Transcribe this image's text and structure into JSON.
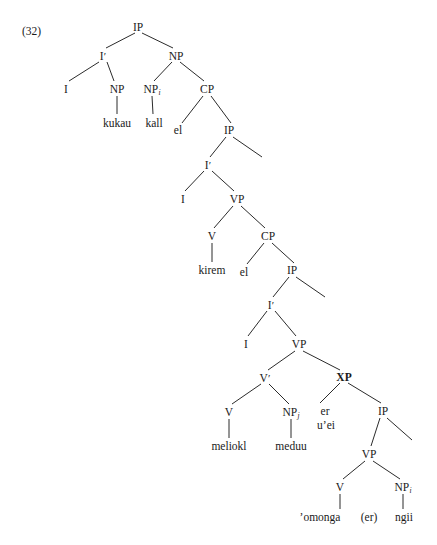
{
  "figure": {
    "example_number": "(32)",
    "cutoff_text_above": "",
    "language": "Palauan syntax tree",
    "line_color": "#2b2b2b",
    "text_color": "#1a1a1a",
    "background_color": "#ffffff"
  },
  "nodes": [
    {
      "id": "ip1",
      "label": "IP",
      "x": 138,
      "y": 28,
      "bold": false,
      "sub": "",
      "prime": false,
      "kind": "category"
    },
    {
      "id": "ibar1",
      "label": "I",
      "x": 103,
      "y": 57,
      "bold": false,
      "sub": "",
      "prime": true,
      "kind": "category"
    },
    {
      "id": "np1",
      "label": "NP",
      "x": 176,
      "y": 57,
      "bold": false,
      "sub": "",
      "prime": false,
      "kind": "category"
    },
    {
      "id": "i1",
      "label": "I",
      "x": 66,
      "y": 90,
      "bold": false,
      "sub": "",
      "prime": false,
      "kind": "category"
    },
    {
      "id": "np2",
      "label": "NP",
      "x": 117,
      "y": 90,
      "bold": false,
      "sub": "",
      "prime": false,
      "kind": "category"
    },
    {
      "id": "np3",
      "label": "NP",
      "x": 152,
      "y": 90,
      "bold": false,
      "sub": "i",
      "prime": false,
      "kind": "category"
    },
    {
      "id": "cp1",
      "label": "CP",
      "x": 207,
      "y": 90,
      "bold": false,
      "sub": "",
      "prime": false,
      "kind": "category"
    },
    {
      "id": "kukau",
      "label": "kukau",
      "x": 117,
      "y": 124,
      "bold": false,
      "sub": "",
      "prime": false,
      "kind": "terminal"
    },
    {
      "id": "kall",
      "label": "kall",
      "x": 154,
      "y": 124,
      "bold": false,
      "sub": "",
      "prime": false,
      "kind": "terminal"
    },
    {
      "id": "el1",
      "label": "el",
      "x": 178,
      "y": 131,
      "bold": false,
      "sub": "",
      "prime": false,
      "kind": "terminal"
    },
    {
      "id": "ip2",
      "label": "IP",
      "x": 229,
      "y": 131,
      "bold": false,
      "sub": "",
      "prime": false,
      "kind": "category"
    },
    {
      "id": "ibar2",
      "label": "I",
      "x": 208,
      "y": 166,
      "bold": false,
      "sub": "",
      "prime": true,
      "kind": "category"
    },
    {
      "id": "i2",
      "label": "I",
      "x": 183,
      "y": 200,
      "bold": false,
      "sub": "",
      "prime": false,
      "kind": "category"
    },
    {
      "id": "vp1",
      "label": "VP",
      "x": 237,
      "y": 200,
      "bold": false,
      "sub": "",
      "prime": false,
      "kind": "category"
    },
    {
      "id": "v1",
      "label": "V",
      "x": 212,
      "y": 237,
      "bold": false,
      "sub": "",
      "prime": false,
      "kind": "category"
    },
    {
      "id": "cp2",
      "label": "CP",
      "x": 268,
      "y": 237,
      "bold": false,
      "sub": "",
      "prime": false,
      "kind": "category"
    },
    {
      "id": "kirem",
      "label": "kirem",
      "x": 212,
      "y": 271,
      "bold": false,
      "sub": "",
      "prime": false,
      "kind": "terminal"
    },
    {
      "id": "el2",
      "label": "el",
      "x": 244,
      "y": 273,
      "bold": false,
      "sub": "",
      "prime": false,
      "kind": "terminal"
    },
    {
      "id": "ip3",
      "label": "IP",
      "x": 292,
      "y": 271,
      "bold": false,
      "sub": "",
      "prime": false,
      "kind": "category"
    },
    {
      "id": "ibar3",
      "label": "I",
      "x": 271,
      "y": 306,
      "bold": false,
      "sub": "",
      "prime": true,
      "kind": "category"
    },
    {
      "id": "i3",
      "label": "I",
      "x": 246,
      "y": 345,
      "bold": false,
      "sub": "",
      "prime": false,
      "kind": "category"
    },
    {
      "id": "vp2",
      "label": "VP",
      "x": 299,
      "y": 345,
      "bold": false,
      "sub": "",
      "prime": false,
      "kind": "category"
    },
    {
      "id": "vbar1",
      "label": "V",
      "x": 265,
      "y": 379,
      "bold": false,
      "sub": "",
      "prime": true,
      "kind": "category"
    },
    {
      "id": "xp1",
      "label": "XP",
      "x": 344,
      "y": 378,
      "bold": true,
      "sub": "",
      "prime": false,
      "kind": "category"
    },
    {
      "id": "v2",
      "label": "V",
      "x": 229,
      "y": 413,
      "bold": false,
      "sub": "",
      "prime": false,
      "kind": "category"
    },
    {
      "id": "np4",
      "label": "NP",
      "x": 291,
      "y": 413,
      "bold": false,
      "sub": "j",
      "prime": false,
      "kind": "category"
    },
    {
      "id": "er1",
      "label": "er",
      "x": 325,
      "y": 412,
      "bold": false,
      "sub": "",
      "prime": false,
      "kind": "terminal"
    },
    {
      "id": "uei",
      "label": "u’ei",
      "x": 326,
      "y": 426,
      "bold": false,
      "sub": "",
      "prime": false,
      "kind": "terminal"
    },
    {
      "id": "ip4",
      "label": "IP",
      "x": 383,
      "y": 412,
      "bold": false,
      "sub": "",
      "prime": false,
      "kind": "category"
    },
    {
      "id": "meliokl",
      "label": "meliokl",
      "x": 229,
      "y": 447,
      "bold": false,
      "sub": "",
      "prime": false,
      "kind": "terminal"
    },
    {
      "id": "meduu",
      "label": "meduu",
      "x": 291,
      "y": 447,
      "bold": false,
      "sub": "",
      "prime": false,
      "kind": "terminal"
    },
    {
      "id": "vp3",
      "label": "VP",
      "x": 369,
      "y": 455,
      "bold": false,
      "sub": "",
      "prime": false,
      "kind": "category"
    },
    {
      "id": "v3",
      "label": "V",
      "x": 340,
      "y": 488,
      "bold": false,
      "sub": "",
      "prime": false,
      "kind": "category"
    },
    {
      "id": "np5",
      "label": "NP",
      "x": 403,
      "y": 488,
      "bold": false,
      "sub": "i",
      "prime": false,
      "kind": "category"
    },
    {
      "id": "omonga",
      "label": "’omonga",
      "x": 320,
      "y": 518,
      "bold": false,
      "sub": "",
      "prime": false,
      "kind": "terminal"
    },
    {
      "id": "erparen",
      "label": "(er)",
      "x": 369,
      "y": 518,
      "bold": false,
      "sub": "",
      "prime": false,
      "kind": "terminal"
    },
    {
      "id": "ngii",
      "label": "ngii",
      "x": 404,
      "y": 518,
      "bold": false,
      "sub": "",
      "prime": false,
      "kind": "terminal"
    }
  ],
  "edges": [
    {
      "from": "ip1",
      "to": "ibar1",
      "x1": 135,
      "y1": 33,
      "x2": 106,
      "y2": 48
    },
    {
      "from": "ip1",
      "to": "np1",
      "x1": 142,
      "y1": 33,
      "x2": 173,
      "y2": 48
    },
    {
      "from": "ibar1",
      "to": "i1",
      "x1": 99,
      "y1": 62,
      "x2": 69,
      "y2": 81
    },
    {
      "from": "ibar1",
      "to": "np2",
      "x1": 107,
      "y1": 62,
      "x2": 114,
      "y2": 81
    },
    {
      "from": "np1",
      "to": "np3",
      "x1": 172,
      "y1": 62,
      "x2": 154,
      "y2": 81
    },
    {
      "from": "np1",
      "to": "cp1",
      "x1": 180,
      "y1": 62,
      "x2": 204,
      "y2": 81
    },
    {
      "from": "np2",
      "to": "kukau",
      "x1": 117,
      "y1": 96,
      "x2": 117,
      "y2": 114
    },
    {
      "from": "np3",
      "to": "kall",
      "x1": 152,
      "y1": 96,
      "x2": 153,
      "y2": 114
    },
    {
      "from": "cp1",
      "to": "el1",
      "x1": 203,
      "y1": 96,
      "x2": 182,
      "y2": 123
    },
    {
      "from": "cp1",
      "to": "ip2",
      "x1": 211,
      "y1": 96,
      "x2": 231,
      "y2": 123
    },
    {
      "from": "ip2",
      "to": "ibar2",
      "x1": 226,
      "y1": 137,
      "x2": 210,
      "y2": 157
    },
    {
      "from": "ip2",
      "to": "right2",
      "x1": 233,
      "y1": 137,
      "x2": 262,
      "y2": 157
    },
    {
      "from": "ibar2",
      "to": "i2",
      "x1": 204,
      "y1": 171,
      "x2": 185,
      "y2": 191
    },
    {
      "from": "ibar2",
      "to": "vp1",
      "x1": 212,
      "y1": 171,
      "x2": 234,
      "y2": 191
    },
    {
      "from": "vp1",
      "to": "v1",
      "x1": 233,
      "y1": 206,
      "x2": 214,
      "y2": 228
    },
    {
      "from": "vp1",
      "to": "cp2",
      "x1": 241,
      "y1": 206,
      "x2": 265,
      "y2": 228
    },
    {
      "from": "v1",
      "to": "kirem",
      "x1": 212,
      "y1": 243,
      "x2": 212,
      "y2": 262
    },
    {
      "from": "cp2",
      "to": "el2",
      "x1": 264,
      "y1": 243,
      "x2": 247,
      "y2": 264
    },
    {
      "from": "cp2",
      "to": "ip3",
      "x1": 272,
      "y1": 243,
      "x2": 294,
      "y2": 263
    },
    {
      "from": "ip3",
      "to": "ibar3",
      "x1": 289,
      "y1": 277,
      "x2": 273,
      "y2": 297
    },
    {
      "from": "ip3",
      "to": "right3",
      "x1": 296,
      "y1": 277,
      "x2": 325,
      "y2": 297
    },
    {
      "from": "ibar3",
      "to": "i3",
      "x1": 267,
      "y1": 311,
      "x2": 248,
      "y2": 336
    },
    {
      "from": "ibar3",
      "to": "vp2",
      "x1": 275,
      "y1": 311,
      "x2": 296,
      "y2": 336
    },
    {
      "from": "vp2",
      "to": "vbar1",
      "x1": 295,
      "y1": 351,
      "x2": 268,
      "y2": 370
    },
    {
      "from": "vp2",
      "to": "xp1",
      "x1": 303,
      "y1": 351,
      "x2": 340,
      "y2": 370
    },
    {
      "from": "vbar1",
      "to": "v2",
      "x1": 261,
      "y1": 384,
      "x2": 232,
      "y2": 404
    },
    {
      "from": "vbar1",
      "to": "np4",
      "x1": 269,
      "y1": 384,
      "x2": 289,
      "y2": 404
    },
    {
      "from": "xp1",
      "to": "erleft",
      "x1": 340,
      "y1": 383,
      "x2": 320,
      "y2": 403
    },
    {
      "from": "xp1",
      "to": "ip4",
      "x1": 348,
      "y1": 383,
      "x2": 381,
      "y2": 403
    },
    {
      "from": "v2",
      "to": "meliokl",
      "x1": 229,
      "y1": 419,
      "x2": 229,
      "y2": 438
    },
    {
      "from": "np4",
      "to": "meduu",
      "x1": 291,
      "y1": 419,
      "x2": 291,
      "y2": 438
    },
    {
      "from": "ip4",
      "to": "vp3",
      "x1": 380,
      "y1": 418,
      "x2": 371,
      "y2": 446
    },
    {
      "from": "ip4",
      "to": "right4",
      "x1": 387,
      "y1": 418,
      "x2": 412,
      "y2": 440
    },
    {
      "from": "vp3",
      "to": "v3",
      "x1": 365,
      "y1": 461,
      "x2": 343,
      "y2": 479
    },
    {
      "from": "vp3",
      "to": "np5",
      "x1": 373,
      "y1": 461,
      "x2": 400,
      "y2": 479
    },
    {
      "from": "v3",
      "to": "omonga",
      "x1": 340,
      "y1": 494,
      "x2": 340,
      "y2": 509
    },
    {
      "from": "np5",
      "to": "ngii",
      "x1": 403,
      "y1": 494,
      "x2": 403,
      "y2": 509
    }
  ]
}
